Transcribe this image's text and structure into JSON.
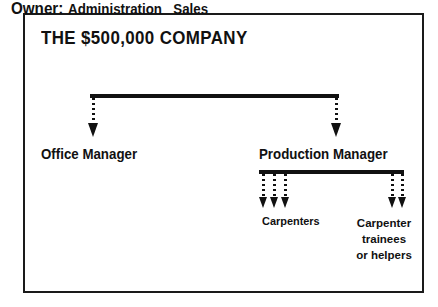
{
  "diagram": {
    "type": "organizational-chart",
    "title": "THE $500,000 COMPANY",
    "background_color": "#ffffff",
    "ink_color": "#111111",
    "border_color": "#1a1a1a",
    "connector_style": "dotted-line-with-solid-arrowhead",
    "levels": [
      {
        "level": 1,
        "label": "Owner: Administration   Sales",
        "parts": [
          "Owner:",
          "Administration",
          "Sales"
        ]
      },
      {
        "level": 2,
        "nodes": [
          "Office Manager",
          "Production Manager"
        ]
      },
      {
        "level": 3,
        "nodes": [
          "Carpenters",
          "Carpenter trainees or helpers"
        ]
      }
    ],
    "owner_row": {
      "owner": "Owner:",
      "administration": "Administration",
      "sales": "Sales"
    },
    "nodes": {
      "office_manager": "Office Manager",
      "production_manager": "Production Manager",
      "carpenters": "Carpenters",
      "trainees_line1": "Carpenter",
      "trainees_line2": "trainees",
      "trainees_line3": "or helpers"
    },
    "connections": {
      "owner_to_office_manager": 1,
      "owner_to_production_manager": 1,
      "production_to_carpenters": 3,
      "production_to_trainees": 2
    }
  }
}
